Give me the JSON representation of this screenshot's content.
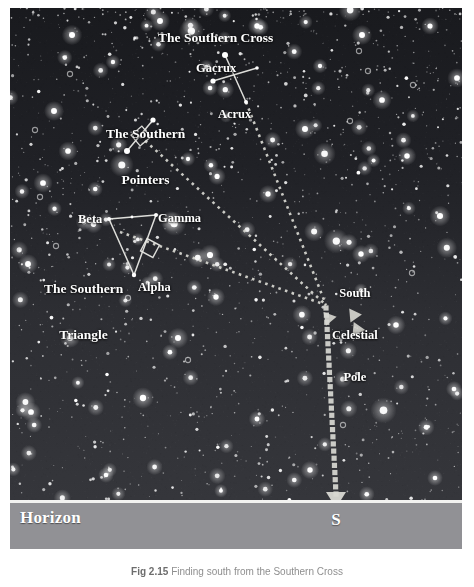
{
  "figure": {
    "caption_figure_number": "Fig 2.15",
    "caption_text": "Finding south from the Southern Cross"
  },
  "sky": {
    "background_color": "#242428",
    "star_color": "#ffffff",
    "line_color": "#e8e8e4",
    "dashed_color": "#d8d8d2"
  },
  "horizon": {
    "label": "Horizon",
    "direction_marker": "S",
    "band_color": "#919195",
    "rule_color": "#f2f2f0"
  },
  "labels": {
    "southern_cross": "The Southern Cross",
    "southern_pointers_line1": "The Southern",
    "southern_pointers_line2": "Pointers",
    "southern_triangle_line1": "The Southern",
    "southern_triangle_line2": "Triangle",
    "south_celestial_pole_line1": "South",
    "south_celestial_pole_line2": "Celestial",
    "south_celestial_pole_line3": "Pole",
    "gacrux": "Gacrux",
    "acrux": "Acrux",
    "beta": "Beta",
    "gamma": "Gamma",
    "alpha": "Alpha"
  },
  "chart_data": {
    "type": "scatter",
    "title": "Finding south from the Southern Cross",
    "xlabel": "",
    "ylabel": "",
    "xlim": [
      0,
      452
    ],
    "ylim": [
      0,
      541
    ],
    "grid": false,
    "legend": "none",
    "named_stars": [
      {
        "name": "Gacrux",
        "x": 215,
        "y": 47,
        "magnitude_size": 7.5
      },
      {
        "name": "Acrux",
        "x": 236,
        "y": 94,
        "magnitude_size": 5.0
      },
      {
        "name": "Cross-E",
        "x": 247,
        "y": 60,
        "magnitude_size": 4.5
      },
      {
        "name": "Cross-W",
        "x": 203,
        "y": 73,
        "magnitude_size": 6.5
      },
      {
        "name": "Pointer-A",
        "x": 143,
        "y": 112,
        "magnitude_size": 6.5
      },
      {
        "name": "Pointer-B",
        "x": 117,
        "y": 143,
        "magnitude_size": 7.5
      },
      {
        "name": "Beta",
        "x": 99,
        "y": 211,
        "magnitude_size": 5.0
      },
      {
        "name": "Gamma",
        "x": 146,
        "y": 207,
        "magnitude_size": 5.0
      },
      {
        "name": "Alpha",
        "x": 124,
        "y": 267,
        "magnitude_size": 5.5
      },
      {
        "name": "Triangle-mid",
        "x": 122,
        "y": 209,
        "magnitude_size": 3.5
      }
    ],
    "south_celestial_pole": {
      "x": 316,
      "y": 297
    },
    "horizon_south_point": {
      "x": 326,
      "y": 492
    },
    "constellation_lines": [
      {
        "name": "cross-long",
        "from": [
          215,
          47
        ],
        "to": [
          236,
          94
        ]
      },
      {
        "name": "cross-short",
        "from": [
          203,
          73
        ],
        "to": [
          247,
          60
        ]
      },
      {
        "name": "pointers",
        "from": [
          143,
          112
        ],
        "to": [
          117,
          143
        ]
      },
      {
        "name": "triangle-beta-gamma",
        "from": [
          99,
          211
        ],
        "to": [
          146,
          207
        ]
      },
      {
        "name": "triangle-gamma-alpha",
        "from": [
          146,
          207
        ],
        "to": [
          124,
          267
        ]
      },
      {
        "name": "triangle-beta-alpha",
        "from": [
          99,
          211
        ],
        "to": [
          124,
          267
        ]
      }
    ],
    "pointer_lines_to_pole": [
      {
        "name": "from-southern-cross",
        "from": [
          236,
          94
        ],
        "to": [
          316,
          297
        ]
      },
      {
        "name": "from-pointers",
        "from": [
          130,
          128
        ],
        "to": [
          316,
          297
        ]
      },
      {
        "name": "from-triangle",
        "from": [
          110,
          224
        ],
        "to": [
          316,
          297
        ]
      }
    ],
    "pole_to_horizon_line": {
      "from": [
        316,
        300
      ],
      "to": [
        326,
        486
      ]
    }
  }
}
